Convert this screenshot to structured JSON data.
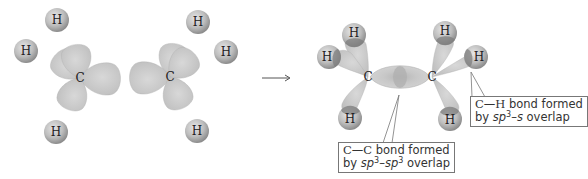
{
  "diagram": {
    "colors": {
      "orbital": "#c9c9c9",
      "orbital_dark": "#a9a9a9",
      "hydrogen": "#b8b8b8",
      "overlap": "#8a8a8a",
      "text": "#222222",
      "callout_border": "#777777"
    },
    "reactants": [
      {
        "name": "methyl-left",
        "carbon": {
          "label": "C",
          "x": 80,
          "y": 78
        },
        "hydrogens": [
          {
            "label": "H",
            "x": 57,
            "y": 20
          },
          {
            "label": "H",
            "x": 26,
            "y": 51
          },
          {
            "label": "H",
            "x": 56,
            "y": 132
          }
        ]
      },
      {
        "name": "methyl-right",
        "carbon": {
          "label": "C",
          "x": 170,
          "y": 77
        },
        "hydrogens": [
          {
            "label": "H",
            "x": 198,
            "y": 22
          },
          {
            "label": "H",
            "x": 226,
            "y": 52
          },
          {
            "label": "H",
            "x": 197,
            "y": 131
          }
        ]
      }
    ],
    "arrow": {
      "symbol": "→",
      "from_x": 262,
      "to_x": 291,
      "y": 78
    },
    "product": {
      "name": "ethane",
      "carbons": [
        {
          "label": "C",
          "x": 368,
          "y": 77
        },
        {
          "label": "C",
          "x": 432,
          "y": 77
        }
      ],
      "hydrogens": [
        {
          "label": "H",
          "x": 354,
          "y": 35
        },
        {
          "label": "H",
          "x": 329,
          "y": 57
        },
        {
          "label": "H",
          "x": 350,
          "y": 118
        },
        {
          "label": "H",
          "x": 445,
          "y": 33
        },
        {
          "label": "H",
          "x": 476,
          "y": 57
        },
        {
          "label": "H",
          "x": 450,
          "y": 119
        }
      ]
    },
    "callouts": [
      {
        "name": "cc-bond",
        "line1_atom1": "C",
        "line1_dash": "—",
        "line1_atom2": "C",
        "line1_text": " bond formed",
        "line2_prefix": "by ",
        "line2_orbital1": "sp",
        "line2_sup1": "3",
        "line2_sep": "–",
        "line2_orbital2": "sp",
        "line2_sup2": "3",
        "line2_suffix": " overlap"
      },
      {
        "name": "ch-bond",
        "line1_atom1": "C",
        "line1_dash": "—",
        "line1_atom2": "H",
        "line1_text": " bond formed",
        "line2_prefix": "by ",
        "line2_orbital1": "sp",
        "line2_sup1": "3",
        "line2_sep": "–",
        "line2_orbital2": "s",
        "line2_suffix": " overlap"
      }
    ]
  }
}
